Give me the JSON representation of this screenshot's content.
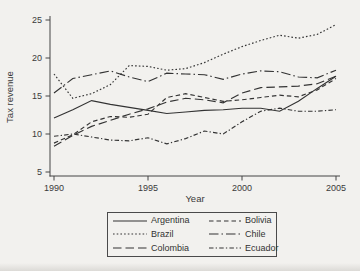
{
  "page": {
    "paper_color": "#f2f1ee",
    "ink_color": "#333333"
  },
  "chart_data": {
    "type": "line",
    "title": "",
    "xlabel": "Year",
    "ylabel": "Tax revenue",
    "xlim": [
      1990,
      2005
    ],
    "ylim": [
      5,
      25
    ],
    "xticks": [
      1990,
      1995,
      2000,
      2005
    ],
    "yticks": [
      5,
      10,
      15,
      20,
      25
    ],
    "grid": false,
    "legend_position": "bottom",
    "line_color": "#333333",
    "x": [
      1990,
      1991,
      1992,
      1993,
      1994,
      1995,
      1996,
      1997,
      1998,
      1999,
      2000,
      2001,
      2002,
      2003,
      2004,
      2005
    ],
    "series": [
      {
        "name": "Argentina",
        "style": "solid",
        "values": [
          12.1,
          13.2,
          14.4,
          13.9,
          13.5,
          13.1,
          12.7,
          12.9,
          13.1,
          13.2,
          13.4,
          13.4,
          13.0,
          14.3,
          16.0,
          17.6
        ]
      },
      {
        "name": "Bolivia",
        "style": "dash",
        "values": [
          8.8,
          9.9,
          11.6,
          12.3,
          12.2,
          12.6,
          14.8,
          15.3,
          14.8,
          14.3,
          14.5,
          14.8,
          15.1,
          14.9,
          15.8,
          17.3
        ]
      },
      {
        "name": "Brazil",
        "style": "dot",
        "values": [
          17.9,
          14.7,
          15.3,
          16.5,
          19.0,
          18.9,
          18.4,
          18.6,
          19.4,
          20.5,
          21.5,
          22.3,
          23.0,
          22.6,
          23.1,
          24.4
        ]
      },
      {
        "name": "Chile",
        "style": "longdash-dot",
        "values": [
          15.4,
          17.3,
          17.8,
          18.3,
          17.5,
          16.9,
          18.0,
          17.9,
          17.8,
          17.2,
          17.9,
          18.3,
          18.2,
          17.5,
          17.4,
          18.4
        ]
      },
      {
        "name": "Colombia",
        "style": "longdash",
        "values": [
          8.4,
          9.8,
          11.0,
          11.8,
          12.6,
          13.3,
          14.2,
          14.7,
          14.5,
          14.1,
          15.4,
          16.1,
          16.2,
          16.3,
          16.6,
          17.6
        ]
      },
      {
        "name": "Ecuador",
        "style": "shortdash-dot",
        "values": [
          9.7,
          10.0,
          9.6,
          9.2,
          9.1,
          9.5,
          8.7,
          9.4,
          10.4,
          10.0,
          11.6,
          13.0,
          13.4,
          13.0,
          13.0,
          13.2
        ]
      }
    ]
  }
}
